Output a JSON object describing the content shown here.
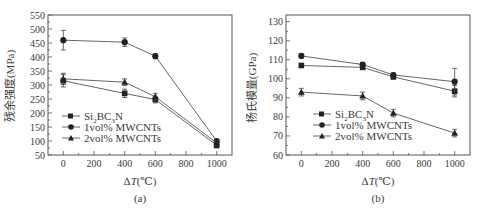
{
  "chart_data": [
    {
      "type": "line",
      "panel_label": "(a)",
      "title": "",
      "xlabel": "ΔT(℃)",
      "ylabel": "残余强度(MPa)",
      "x": [
        0,
        400,
        600,
        1000
      ],
      "xticks": [
        0,
        200,
        400,
        600,
        800,
        1000
      ],
      "yticks": [
        50,
        100,
        150,
        200,
        250,
        300,
        350,
        400,
        450,
        500,
        550
      ],
      "xlim": [
        -100,
        1100
      ],
      "ylim": [
        50,
        550
      ],
      "grid": false,
      "legend_position": "lower left",
      "series": [
        {
          "name": "Si2BC3N",
          "marker": "square",
          "values": [
            315,
            270,
            248,
            85
          ],
          "errors": [
            22,
            15,
            12,
            10
          ]
        },
        {
          "name": "1vol% MWCNTs",
          "marker": "circle",
          "values": [
            460,
            453,
            403,
            100
          ],
          "errors": [
            35,
            15,
            8,
            6
          ]
        },
        {
          "name": "2vol% MWCNTs",
          "marker": "triangle",
          "values": [
            322,
            310,
            258,
            93
          ],
          "errors": [
            20,
            12,
            12,
            8
          ]
        }
      ]
    },
    {
      "type": "line",
      "panel_label": "(b)",
      "title": "",
      "xlabel": "ΔT(℃)",
      "ylabel": "杨氏模量(GPa)",
      "x": [
        0,
        400,
        600,
        1000
      ],
      "xticks": [
        0,
        200,
        400,
        600,
        800,
        1000
      ],
      "yticks": [
        60,
        70,
        80,
        90,
        100,
        110,
        120,
        130
      ],
      "xlim": [
        -100,
        1100
      ],
      "ylim": [
        60,
        135
      ],
      "grid": false,
      "legend_position": "lower left",
      "series": [
        {
          "name": "Si2BC3N",
          "marker": "square",
          "values": [
            107,
            106,
            101,
            93.5
          ],
          "errors": [
            1,
            1,
            1,
            3
          ]
        },
        {
          "name": "1vol% MWCNTs",
          "marker": "circle",
          "values": [
            112,
            107.5,
            102,
            98.5
          ],
          "errors": [
            1,
            1,
            1,
            7
          ]
        },
        {
          "name": "2vol% MWCNTs",
          "marker": "triangle",
          "values": [
            93,
            91,
            82,
            71.5
          ],
          "errors": [
            2,
            2,
            2,
            2
          ]
        }
      ]
    }
  ],
  "legend_labels": {
    "s1_main": "Si",
    "s1_sub1": "2",
    "s1_mid": "BC",
    "s1_sub2": "3",
    "s1_end": "N",
    "s2": "1vol% MWCNTs",
    "s3": "2vol% MWCNTs"
  },
  "panels": {
    "a": {
      "label": "(a)",
      "ylabel": "残余强度(MPa)",
      "xlabel_delta": "Δ",
      "xlabel_T": "T",
      "xlabel_unit": "(℃)"
    },
    "b": {
      "label": "(b)",
      "ylabel": "杨氏模量(GPa)",
      "xlabel_delta": "Δ",
      "xlabel_T": "T",
      "xlabel_unit": "(℃)"
    }
  }
}
